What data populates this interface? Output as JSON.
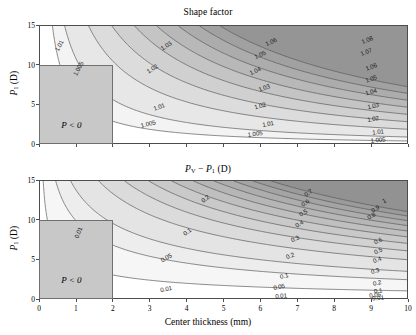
{
  "figure": {
    "width": 416,
    "height": 335,
    "background": "#ffffff"
  },
  "chart_data": [
    {
      "type": "contour",
      "panel": "top",
      "title": "Shape factor",
      "xlabel": "",
      "ylabel": "P_1 (D)",
      "xlim": [
        0,
        10
      ],
      "ylim": [
        0,
        15
      ],
      "xticks": [
        0,
        1,
        2,
        3,
        4,
        5,
        6,
        7,
        8,
        9,
        10
      ],
      "yticks": [
        0,
        5,
        10,
        15
      ],
      "grid": false,
      "levels": [
        1.005,
        1.01,
        1.02,
        1.03,
        1.04,
        1.05,
        1.06,
        1.07,
        1.08
      ],
      "level_labels": [
        "1.005",
        "1.01",
        "1.02",
        "1.03",
        "1.04",
        "1.05",
        "1.06",
        "1.07",
        "1.08"
      ],
      "colormap": "grayscale-light-to-dark",
      "description": "Shape factor increases from lower-left (white, ~1.00) toward upper-right (dark gray, >1.08); contours are hyperbola-like curves.",
      "mask_region": {
        "label": "P < 0",
        "x_range": [
          0,
          2
        ],
        "y_range": [
          0,
          10
        ],
        "fill": "#c8c8c8"
      },
      "contour_labels": [
        {
          "text": "1.01",
          "x": 0.55,
          "y": 12.3,
          "rot": -62
        },
        {
          "text": "1.005",
          "x": 1.05,
          "y": 9.4,
          "rot": -62
        },
        {
          "text": "1.03",
          "x": 3.45,
          "y": 12.4,
          "rot": -34
        },
        {
          "text": "1.02",
          "x": 3.05,
          "y": 9.4,
          "rot": -34
        },
        {
          "text": "1.01",
          "x": 3.25,
          "y": 4.7,
          "rot": -18
        },
        {
          "text": "1.005",
          "x": 2.95,
          "y": 2.5,
          "rot": -14
        },
        {
          "text": "1.06",
          "x": 6.3,
          "y": 12.9,
          "rot": -26
        },
        {
          "text": "1.05",
          "x": 6.0,
          "y": 11.2,
          "rot": -26
        },
        {
          "text": "1.04",
          "x": 5.85,
          "y": 9.2,
          "rot": -24
        },
        {
          "text": "1.03",
          "x": 6.1,
          "y": 7.0,
          "rot": -20
        },
        {
          "text": "1.02",
          "x": 6.0,
          "y": 4.8,
          "rot": -16
        },
        {
          "text": "1.01",
          "x": 6.2,
          "y": 2.5,
          "rot": -10
        },
        {
          "text": "1.005",
          "x": 5.85,
          "y": 1.2,
          "rot": -8
        },
        {
          "text": "1.08",
          "x": 8.9,
          "y": 13.1,
          "rot": -22
        },
        {
          "text": "1.07",
          "x": 8.85,
          "y": 11.6,
          "rot": -22
        },
        {
          "text": "1.06",
          "x": 9.0,
          "y": 9.7,
          "rot": -20
        },
        {
          "text": "1.05",
          "x": 9.0,
          "y": 8.2,
          "rot": -18
        },
        {
          "text": "1.04",
          "x": 9.0,
          "y": 6.5,
          "rot": -16
        },
        {
          "text": "1.03",
          "x": 9.05,
          "y": 4.8,
          "rot": -13
        },
        {
          "text": "1.02",
          "x": 9.05,
          "y": 3.2,
          "rot": -10
        },
        {
          "text": "1.01",
          "x": 9.2,
          "y": 1.5,
          "rot": -7
        },
        {
          "text": "1.005",
          "x": 9.2,
          "y": 0.5,
          "rot": -5
        }
      ]
    },
    {
      "type": "contour",
      "panel": "bottom",
      "title": "P_V - P_1 (D)",
      "xlabel": "Center thickness (mm)",
      "ylabel": "P_1 (D)",
      "xlim": [
        0,
        10
      ],
      "ylim": [
        0,
        15
      ],
      "xticks": [
        0,
        1,
        2,
        3,
        4,
        5,
        6,
        7,
        8,
        9,
        10
      ],
      "yticks": [
        0,
        5,
        10,
        15
      ],
      "grid": false,
      "levels": [
        0.01,
        0.05,
        0.1,
        0.2,
        0.3,
        0.4,
        0.5,
        0.6,
        0.7,
        0.8,
        0.9,
        1.0
      ],
      "level_labels": [
        "0.01",
        "0.05",
        "0.1",
        "0.2",
        "0.3",
        "0.4",
        "0.5",
        "0.6",
        "0.7",
        "0.8",
        "0.9",
        "1"
      ],
      "colormap": "grayscale-light-to-dark",
      "description": "Vertex power minus P1 rises from white near the axes to dark gray at upper-right; contours are hyperbola-like curves.",
      "mask_region": {
        "label": "P < 0",
        "x_range": [
          0,
          2
        ],
        "y_range": [
          0,
          10
        ],
        "fill": "#c8c8c8"
      },
      "contour_labels": [
        {
          "text": "0.01",
          "x": 1.05,
          "y": 8.3,
          "rot": -68
        },
        {
          "text": "0.2",
          "x": 4.5,
          "y": 12.6,
          "rot": -40
        },
        {
          "text": "0.1",
          "x": 4.0,
          "y": 8.4,
          "rot": -38
        },
        {
          "text": "0.05",
          "x": 3.45,
          "y": 5.2,
          "rot": -30
        },
        {
          "text": "0.01",
          "x": 3.45,
          "y": 1.3,
          "rot": -12
        },
        {
          "text": "0.7",
          "x": 7.3,
          "y": 13.3,
          "rot": -34
        },
        {
          "text": "0.6",
          "x": 7.2,
          "y": 12.1,
          "rot": -34
        },
        {
          "text": "0.5",
          "x": 7.15,
          "y": 10.9,
          "rot": -32
        },
        {
          "text": "0.4",
          "x": 7.05,
          "y": 9.4,
          "rot": -30
        },
        {
          "text": "0.3",
          "x": 6.95,
          "y": 7.6,
          "rot": -26
        },
        {
          "text": "0.2",
          "x": 6.8,
          "y": 5.4,
          "rot": -22
        },
        {
          "text": "0.1",
          "x": 6.65,
          "y": 2.9,
          "rot": -14
        },
        {
          "text": "0.05",
          "x": 6.5,
          "y": 1.5,
          "rot": -10
        },
        {
          "text": "0.01",
          "x": 6.55,
          "y": 0.35,
          "rot": -5
        },
        {
          "text": "1",
          "x": 9.35,
          "y": 12.3,
          "rot": -30
        },
        {
          "text": "0.9",
          "x": 9.1,
          "y": 11.4,
          "rot": -30
        },
        {
          "text": "0.8",
          "x": 9.0,
          "y": 10.4,
          "rot": -30
        },
        {
          "text": "0.6",
          "x": 9.2,
          "y": 7.3,
          "rot": -26
        },
        {
          "text": "0.5",
          "x": 9.2,
          "y": 6.1,
          "rot": -24
        },
        {
          "text": "0.4",
          "x": 9.15,
          "y": 4.9,
          "rot": -22
        },
        {
          "text": "0.3",
          "x": 9.1,
          "y": 3.5,
          "rot": -18
        },
        {
          "text": "0.2",
          "x": 9.15,
          "y": 2.0,
          "rot": -13
        },
        {
          "text": "0.1",
          "x": 9.2,
          "y": 0.95,
          "rot": -9
        },
        {
          "text": "0.05",
          "x": 9.1,
          "y": 0.45,
          "rot": -7
        },
        {
          "text": "0.01",
          "x": 9.2,
          "y": 0.12,
          "rot": -4
        }
      ]
    }
  ],
  "axes": {
    "x_tick_labels": [
      "0",
      "1",
      "2",
      "3",
      "4",
      "5",
      "6",
      "7",
      "8",
      "9",
      "10"
    ],
    "y_tick_labels": [
      "0",
      "5",
      "10",
      "15"
    ],
    "x_axis_title": "Center thickness (mm)",
    "y_axis_title_prefix": "P",
    "y_axis_title_sub": "1",
    "y_axis_title_suffix": " (D)"
  },
  "titles": {
    "top_title": "Shape factor",
    "bottom_title_p": "P",
    "bottom_title_sub_v": "V",
    "bottom_title_minus": " − ",
    "bottom_title_p2": "P",
    "bottom_title_sub_1": "1",
    "bottom_title_units": " (D)"
  },
  "annotations": {
    "p_less_than_zero": "P < 0"
  },
  "colors": {
    "mask_fill": "#c8c8c8",
    "mask_border": "#707070",
    "axis": "#4d4d4d",
    "contour_line": "#595959",
    "band_lightest": "#ffffff",
    "band_darkest": "#909090",
    "text": "#000000"
  }
}
